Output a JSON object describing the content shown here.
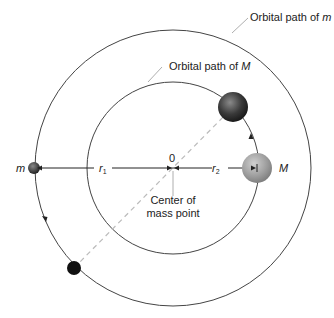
{
  "labels": {
    "orbital_m_prefix": "Orbital path of ",
    "orbital_m_var": "m",
    "orbital_M_prefix": "Orbital path of ",
    "orbital_M_var": "M",
    "small_mass": "m",
    "large_mass": "M",
    "r1": "r",
    "r1_sub": "1",
    "r2": "r",
    "r2_sub": "2",
    "origin": "0",
    "center_line1": "Center of",
    "center_line2": "mass point"
  },
  "colors": {
    "orbit": "#444444",
    "dashed": "#bbbbbb",
    "big_mass": "#9a9a9a",
    "dark_mass": "#3a3a3a"
  }
}
